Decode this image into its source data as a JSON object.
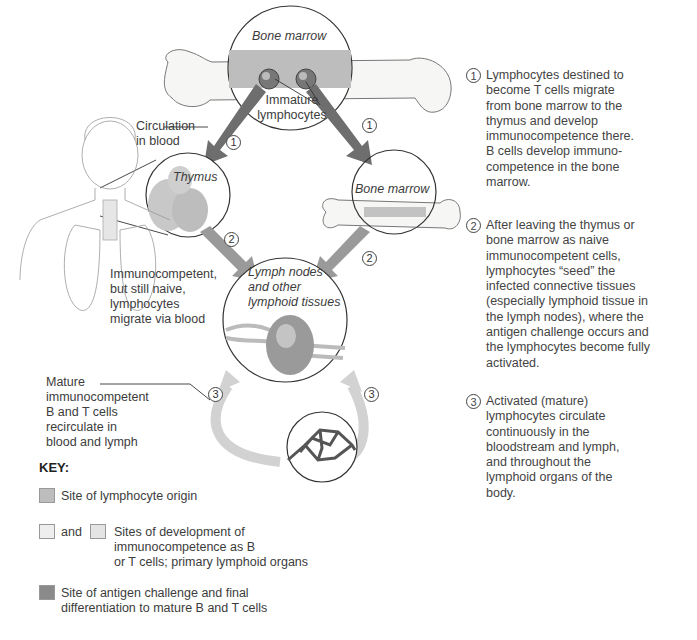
{
  "diagram": {
    "regions": {
      "bone_marrow_top": "Bone marrow",
      "immature_lymphocytes": "Immature\nlymphocytes",
      "circulation": "Circulation\nin blood",
      "thymus": "Thymus",
      "bone_marrow_right": "Bone marrow",
      "lymph_nodes": "Lymph nodes\nand other\nlymphoid tissues",
      "naive_note": "Immunocompetent,\nbut still naive,\nlymphocytes\nmigrate via blood",
      "mature_note": "Mature\nimmunocompetent\nB and T cells\nrecirculate in\nblood and lymph"
    },
    "step_markers": [
      "1",
      "1",
      "2",
      "2",
      "3",
      "3"
    ]
  },
  "steps": [
    {
      "num": "1",
      "text": "Lymphocytes destined to\nbecome T cells migrate\nfrom bone marrow to the\nthymus and develop\nimmunocompetence there.\nB cells develop immuno-\ncompetence in the bone\nmarrow."
    },
    {
      "num": "2",
      "text": "After leaving the thymus or\nbone marrow as naive\nimmunocompetent cells,\nlymphocytes “seed” the\ninfected connective tissues\n(especially lymphoid tissue in\nthe lymph nodes), where the\nantigen challenge occurs and\nthe lymphocytes become fully\nactivated."
    },
    {
      "num": "3",
      "text": "Activated (mature)\nlymphocytes circulate\ncontinuously in the\nbloodstream and lymph,\nand throughout the\nlymphoid organs of the\nbody."
    }
  ],
  "key": {
    "title": "KEY:",
    "items": [
      {
        "label": "Site of lymphocyte origin",
        "color": "#bdbdbd"
      },
      {
        "connector": "and",
        "label": "Sites of development of\nimmunocompetence as B\nor T cells; primary lymphoid organs",
        "colors": [
          "#eeeeee",
          "#e4e4e4"
        ]
      },
      {
        "label": "Site of antigen challenge and final\ndifferentiation to mature B and T cells",
        "color": "#8a8a8a"
      }
    ]
  },
  "colors": {
    "arrow_dark": "#6e6e6e",
    "arrow_medium": "#9a9a9a",
    "arrow_light": "#d2d2d2",
    "outline": "#333333"
  }
}
